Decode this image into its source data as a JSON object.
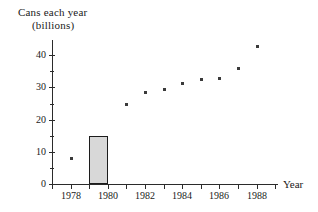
{
  "chart_data": {
    "type": "scatter",
    "title": "Cans each year (billions)",
    "title_lines": [
      "Cans each year",
      "(billions)"
    ],
    "xlabel": "Year",
    "ylabel": "Cans each year (billions)",
    "xlim": [
      1977,
      1989
    ],
    "ylim": [
      0,
      45
    ],
    "grid": false,
    "legend": null,
    "y_major_ticks": [
      0,
      10,
      20,
      30,
      40
    ],
    "y_major_tick_labels": [
      "0",
      "10",
      "20",
      "30",
      "40"
    ],
    "y_minor_ticks": [
      5,
      15,
      25,
      35,
      45
    ],
    "x_ticks": [
      1977,
      1978,
      1979,
      1980,
      1981,
      1982,
      1983,
      1984,
      1985,
      1986,
      1987,
      1988,
      1989
    ],
    "x_tick_labels": [
      {
        "year": 1978,
        "label": "1978"
      },
      {
        "year": 1980,
        "label": "1980"
      },
      {
        "year": 1982,
        "label": "1982"
      },
      {
        "year": 1984,
        "label": "1984"
      },
      {
        "year": 1986,
        "label": "1986"
      },
      {
        "year": 1988,
        "label": "1988"
      }
    ],
    "x": [
      1978,
      1981,
      1982,
      1983,
      1984,
      1985,
      1986,
      1987,
      1988
    ],
    "values": [
      8,
      25,
      28.5,
      29.5,
      31.5,
      32.5,
      33,
      36,
      43
    ],
    "points": [
      {
        "x": 1978,
        "y": 8
      },
      {
        "x": 1981,
        "y": 25
      },
      {
        "x": 1982,
        "y": 28.5
      },
      {
        "x": 1983,
        "y": 29.5
      },
      {
        "x": 1984,
        "y": 31.5
      },
      {
        "x": 1985,
        "y": 32.5
      },
      {
        "x": 1986,
        "y": 33
      },
      {
        "x": 1987,
        "y": 36
      },
      {
        "x": 1988,
        "y": 43
      }
    ],
    "overlay_bar": {
      "x_start": 1979,
      "x_end": 1980,
      "height": 15,
      "fill_color": "#d8d8d8",
      "edge_color": "#1c1c1c"
    },
    "marker_color": "#3a3a3a",
    "axis_color": "#2b2b2b"
  }
}
